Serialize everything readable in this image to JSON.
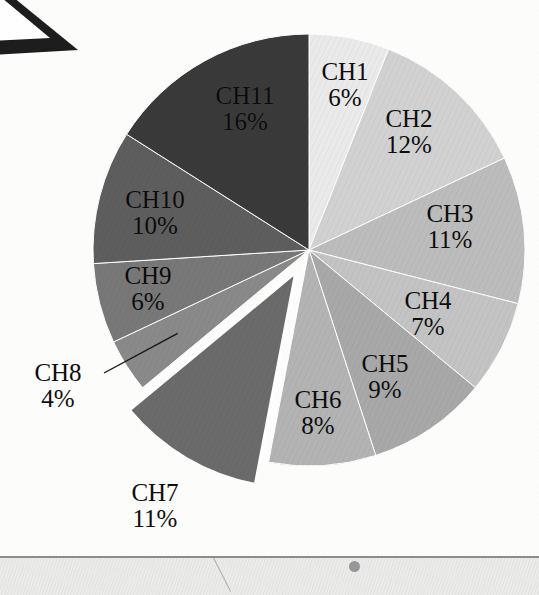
{
  "figure": {
    "background_color": "#fdfdfc",
    "label_text_color": "#0d0d0d"
  },
  "artifacts": {
    "corner_triangle": {
      "name": "corner-triangle-artifact",
      "color": "#1d1d1d"
    },
    "desk_band": {
      "name": "desk-band",
      "color": "#ececeb",
      "edge_color": "#8d8d8f"
    },
    "desk_dot": {
      "name": "desk-dot",
      "color": "#979799"
    }
  },
  "chart_data": {
    "type": "pie",
    "title": "",
    "subtitle": "",
    "xlabel": "",
    "ylabel": "",
    "legend_position": "none",
    "grid": false,
    "label_format": "name + percent",
    "start_angle_deg": 0,
    "direction": "clockwise",
    "exploded_slices": [
      "CH7"
    ],
    "categories": [
      "CH1",
      "CH2",
      "CH3",
      "CH4",
      "CH5",
      "CH6",
      "CH7",
      "CH8",
      "CH9",
      "CH10",
      "CH11"
    ],
    "values": [
      6,
      12,
      11,
      7,
      9,
      8,
      11,
      4,
      6,
      10,
      16
    ],
    "unit": "%",
    "total": 100,
    "colors": [
      "#ebebeb",
      "#d2d2d2",
      "#bdbdbd",
      "#c4c4c4",
      "#a9a9a9",
      "#b4b4b4",
      "#6b6b6b",
      "#8a8a8a",
      "#787878",
      "#5e5e5e",
      "#3a3a3a"
    ],
    "slices": [
      {
        "name": "CH1",
        "value": 6,
        "percent_label": "6%",
        "color": "#ebebeb",
        "exploded": false,
        "label_placement": "inside",
        "label_x": 345,
        "label_y": 84
      },
      {
        "name": "CH2",
        "value": 12,
        "percent_label": "12%",
        "color": "#d2d2d2",
        "exploded": false,
        "label_placement": "inside",
        "label_x": 409,
        "label_y": 131
      },
      {
        "name": "CH3",
        "value": 11,
        "percent_label": "11%",
        "color": "#bdbdbd",
        "exploded": false,
        "label_placement": "inside",
        "label_x": 450,
        "label_y": 226
      },
      {
        "name": "CH4",
        "value": 7,
        "percent_label": "7%",
        "color": "#c4c4c4",
        "exploded": false,
        "label_placement": "inside",
        "label_x": 428,
        "label_y": 313
      },
      {
        "name": "CH5",
        "value": 9,
        "percent_label": "9%",
        "color": "#a9a9a9",
        "exploded": false,
        "label_placement": "inside",
        "label_x": 385,
        "label_y": 376
      },
      {
        "name": "CH6",
        "value": 8,
        "percent_label": "8%",
        "color": "#b4b4b4",
        "exploded": false,
        "label_placement": "inside",
        "label_x": 318,
        "label_y": 412
      },
      {
        "name": "CH7",
        "value": 11,
        "percent_label": "11%",
        "color": "#6b6b6b",
        "exploded": true,
        "label_placement": "outside",
        "label_x": 155,
        "label_y": 505
      },
      {
        "name": "CH8",
        "value": 4,
        "percent_label": "4%",
        "color": "#8a8a8a",
        "exploded": false,
        "label_placement": "outside",
        "label_x": 58,
        "label_y": 385
      },
      {
        "name": "CH9",
        "value": 6,
        "percent_label": "6%",
        "color": "#787878",
        "exploded": false,
        "label_placement": "inside",
        "label_x": 148,
        "label_y": 288
      },
      {
        "name": "CH10",
        "value": 10,
        "percent_label": "10%",
        "color": "#5e5e5e",
        "exploded": false,
        "label_placement": "inside",
        "label_x": 155,
        "label_y": 212
      },
      {
        "name": "CH11",
        "value": 16,
        "percent_label": "16%",
        "color": "#3a3a3a",
        "exploded": false,
        "label_placement": "inside",
        "label_x": 245,
        "label_y": 108
      }
    ],
    "geometry": {
      "center_x": 309,
      "center_y": 250,
      "radius": 216,
      "explode_offset": 26
    }
  }
}
